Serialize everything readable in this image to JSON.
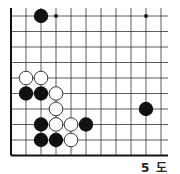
{
  "diagram": {
    "type": "go-board-fragment",
    "caption": "5 도",
    "grid": {
      "columns": 11,
      "rows": 10,
      "origin_x": 11,
      "origin_y": 16,
      "col_spacing": 15,
      "row_spacing": 15.5,
      "borders": {
        "left": true,
        "bottom": true,
        "top": false,
        "right": false
      }
    },
    "colors": {
      "line": "#333333",
      "border": "#111111",
      "black_stone": "#111111",
      "white_stone": "#ffffff",
      "white_outline": "#222222"
    },
    "hoshi": [
      {
        "col": 3,
        "row": 0
      },
      {
        "col": 9,
        "row": 0
      }
    ],
    "stones": [
      {
        "color": "black",
        "col": 2,
        "row": 0
      },
      {
        "color": "white",
        "col": 1,
        "row": 4
      },
      {
        "color": "white",
        "col": 2,
        "row": 4
      },
      {
        "color": "black",
        "col": 1,
        "row": 5
      },
      {
        "color": "black",
        "col": 2,
        "row": 5
      },
      {
        "color": "white",
        "col": 3,
        "row": 5
      },
      {
        "color": "white",
        "col": 3,
        "row": 6
      },
      {
        "color": "black",
        "col": 9,
        "row": 6
      },
      {
        "color": "black",
        "col": 2,
        "row": 7
      },
      {
        "color": "white",
        "col": 3,
        "row": 7
      },
      {
        "color": "white",
        "col": 4,
        "row": 7
      },
      {
        "color": "black",
        "col": 5,
        "row": 7
      },
      {
        "color": "black",
        "col": 2,
        "row": 8
      },
      {
        "color": "black",
        "col": 3,
        "row": 8
      },
      {
        "color": "white",
        "col": 4,
        "row": 8
      }
    ]
  }
}
